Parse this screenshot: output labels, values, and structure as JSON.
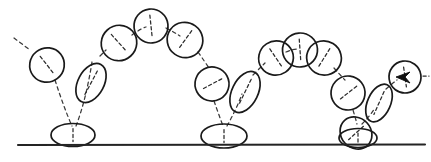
{
  "figure": {
    "description": "Hand drawn animation timing chart: a ball bounces three times along a ground line with decreasing arc heights, stretching on fast travel and squashing flat on contact.",
    "background_color": "#ffffff",
    "ink_color": "#1a1a1a",
    "trail_color": "#3a3a3a",
    "ground_color": "#242424",
    "arrow_color": "#111111"
  },
  "ground": {
    "label": "ground-line",
    "x1": 18,
    "y1": 145,
    "x2": 425,
    "y2": 144.5
  },
  "balls": [
    {
      "id": "ball-01-entry",
      "phase": "falling",
      "shape": "circle",
      "cx": 47,
      "cy": 65,
      "rx": 17.5,
      "ry": 17,
      "rotation": -38,
      "axis_length": 22
    },
    {
      "id": "ball-02-contact-squash-1",
      "phase": "contact-squash",
      "shape": "ellipse",
      "cx": 73,
      "cy": 135,
      "rx": 22,
      "ry": 11.5,
      "rotation": 0,
      "axis_length": 13
    },
    {
      "id": "ball-03-stretch-up-1",
      "phase": "stretch-rising",
      "shape": "ellipse",
      "cx": 91,
      "cy": 83,
      "rx": 13,
      "ry": 21,
      "rotation": 28,
      "axis_length": 27
    },
    {
      "id": "ball-04-rise-1",
      "phase": "rising",
      "shape": "circle",
      "cx": 119,
      "cy": 43,
      "rx": 18,
      "ry": 17.5,
      "rotation": -42,
      "axis_length": 23
    },
    {
      "id": "ball-05-apex-1",
      "phase": "apex",
      "shape": "circle",
      "cx": 151,
      "cy": 26,
      "rx": 17,
      "ry": 17,
      "rotation": -6,
      "axis_length": 22
    },
    {
      "id": "ball-06-fall-1",
      "phase": "falling",
      "shape": "circle",
      "cx": 185,
      "cy": 40,
      "rx": 18,
      "ry": 17.5,
      "rotation": 36,
      "axis_length": 23
    },
    {
      "id": "ball-07-fall-2",
      "phase": "falling",
      "shape": "circle",
      "cx": 212,
      "cy": 84,
      "rx": 17,
      "ry": 17,
      "rotation": 62,
      "axis_length": 22
    },
    {
      "id": "ball-08-contact-squash-2",
      "phase": "contact-squash",
      "shape": "ellipse",
      "cx": 224,
      "cy": 136,
      "rx": 23,
      "ry": 12,
      "rotation": 0,
      "axis_length": 13
    },
    {
      "id": "ball-09-stretch-up-2",
      "phase": "stretch-rising",
      "shape": "ellipse",
      "cx": 245,
      "cy": 92,
      "rx": 13,
      "ry": 22,
      "rotation": 26,
      "axis_length": 28
    },
    {
      "id": "ball-10-rise-2",
      "phase": "rising",
      "shape": "circle",
      "cx": 276,
      "cy": 58,
      "rx": 17.5,
      "ry": 17,
      "rotation": -34,
      "axis_length": 22
    },
    {
      "id": "ball-11-apex-2",
      "phase": "apex",
      "shape": "circle",
      "cx": 300,
      "cy": 50,
      "rx": 17.5,
      "ry": 17,
      "rotation": -4,
      "axis_length": 22
    },
    {
      "id": "ball-12-apex-2b",
      "phase": "apex",
      "shape": "circle",
      "cx": 324,
      "cy": 58,
      "rx": 17.5,
      "ry": 17,
      "rotation": 32,
      "axis_length": 22
    },
    {
      "id": "ball-13-fall-3",
      "phase": "falling",
      "shape": "circle",
      "cx": 348,
      "cy": 93,
      "rx": 17,
      "ry": 17,
      "rotation": 52,
      "axis_length": 22
    },
    {
      "id": "ball-14-contact-squash-3",
      "phase": "contact-squash",
      "shape": "circle",
      "cx": 356,
      "cy": 133,
      "rx": 17,
      "ry": 15,
      "rotation": 48,
      "axis_length": 20
    },
    {
      "id": "ball-15-contact-squash-3b",
      "phase": "contact-squash",
      "shape": "ellipse",
      "cx": 358,
      "cy": 138,
      "rx": 19,
      "ry": 9.5,
      "rotation": 0,
      "axis_length": 10
    },
    {
      "id": "ball-16-stretch-up-3",
      "phase": "stretch-rising",
      "shape": "ellipse",
      "cx": 379,
      "cy": 103,
      "rx": 11.5,
      "ry": 20,
      "rotation": 24,
      "axis_length": 25
    },
    {
      "id": "ball-17-final-marked",
      "phase": "final-marked",
      "shape": "circle",
      "cx": 405,
      "cy": 77,
      "rx": 16,
      "ry": 16,
      "rotation": -8,
      "axis_length": 20
    }
  ],
  "arcs": [
    {
      "id": "arc-entry-to-contact-1",
      "d": "M 14 38 L 30 50 M 55 80 Q 64 108 72 126"
    },
    {
      "id": "arc-contact-1-to-apex",
      "d": "M 76 126 Q 86 100 92 62 M 100 56 L 106 50 M 132 35 Q 140 29 146 27"
    },
    {
      "id": "arc-apex-1-to-contact-2",
      "d": "M 166 28 Q 174 32 180 36 M 198 52 Q 205 62 209 68 M 214 101 Q 220 118 223 126"
    },
    {
      "id": "arc-contact-2-to-apex-2",
      "d": "M 227 126 Q 236 110 242 94 M 253 75 Q 260 68 265 63 M 286 52 Q 293 49 297 49"
    },
    {
      "id": "arc-apex-2-to-contact-3",
      "d": "M 334 68 Q 341 76 345 80 M 353 110 Q 356 120 357 124"
    },
    {
      "id": "arc-contact-3-to-final",
      "d": "M 362 124 Q 370 116 375 108 M 386 89 Q 393 83 397 80"
    }
  ],
  "final_marker": {
    "label": "direction-arrow",
    "head_points": "396,77 410,72 405,77 410,83",
    "tail_d": "M 423 76 L 429 76",
    "note": "solid arrowhead inside final ball pointing right"
  }
}
